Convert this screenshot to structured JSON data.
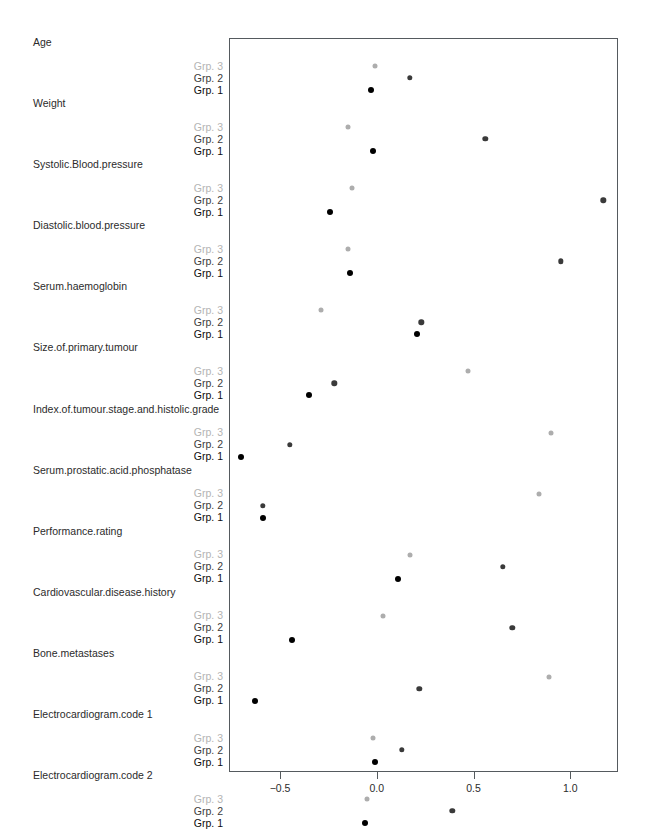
{
  "chart_data": {
    "type": "scatter",
    "title": "",
    "xlabel": "",
    "ylabel": "",
    "xlim": [
      -0.78,
      1.25
    ],
    "grid": false,
    "legend_position": "none",
    "axis_ticks": [
      {
        "value": -0.5,
        "label": "−0.5"
      },
      {
        "value": 0.0,
        "label": "0.0"
      },
      {
        "value": 0.5,
        "label": "0.5"
      },
      {
        "value": 1.0,
        "label": "1.0"
      }
    ],
    "series": [
      {
        "name": "Grp. 1",
        "color": "#000000",
        "style": "s1"
      },
      {
        "name": "Grp. 2",
        "color": "#3a3a3a",
        "style": "s2"
      },
      {
        "name": "Grp. 3",
        "color": "#adadad",
        "style": "s3"
      }
    ],
    "categories": [
      "Age",
      "Weight",
      "Systolic.Blood.pressure",
      "Diastolic.blood.pressure",
      "Serum.haemoglobin",
      "Size.of.primary.tumour",
      "Index.of.tumour.stage.and.histolic.grade",
      "Serum.prostatic.acid.phosphatase",
      "Performance.rating",
      "Cardiovascular.disease.history",
      "Bone.metastases",
      "Electrocardiogram.code 1",
      "Electrocardiogram.code 2"
    ],
    "groups": [
      {
        "category": "Age",
        "values": {
          "Grp. 1": -0.03,
          "Grp. 2": 0.17,
          "Grp. 3": -0.01
        }
      },
      {
        "category": "Weight",
        "values": {
          "Grp. 1": -0.02,
          "Grp. 2": 0.56,
          "Grp. 3": -0.15
        }
      },
      {
        "category": "Systolic.Blood.pressure",
        "values": {
          "Grp. 1": -0.24,
          "Grp. 2": 1.17,
          "Grp. 3": -0.13
        }
      },
      {
        "category": "Diastolic.blood.pressure",
        "values": {
          "Grp. 1": -0.14,
          "Grp. 2": 0.95,
          "Grp. 3": -0.15
        }
      },
      {
        "category": "Serum.haemoglobin",
        "values": {
          "Grp. 1": 0.21,
          "Grp. 2": 0.23,
          "Grp. 3": -0.29
        }
      },
      {
        "category": "Size.of.primary.tumour",
        "values": {
          "Grp. 1": -0.35,
          "Grp. 2": -0.22,
          "Grp. 3": 0.47
        }
      },
      {
        "category": "Index.of.tumour.stage.and.histolic.grade",
        "values": {
          "Grp. 1": -0.7,
          "Grp. 2": -0.45,
          "Grp. 3": 0.9
        }
      },
      {
        "category": "Serum.prostatic.acid.phosphatase",
        "values": {
          "Grp. 1": -0.59,
          "Grp. 2": -0.59,
          "Grp. 3": 0.84
        }
      },
      {
        "category": "Performance.rating",
        "values": {
          "Grp. 1": 0.11,
          "Grp. 2": 0.65,
          "Grp. 3": 0.17
        }
      },
      {
        "category": "Cardiovascular.disease.history",
        "values": {
          "Grp. 1": -0.44,
          "Grp. 2": 0.7,
          "Grp. 3": 0.03
        }
      },
      {
        "category": "Bone.metastases",
        "values": {
          "Grp. 1": -0.63,
          "Grp. 2": 0.22,
          "Grp. 3": 0.89
        }
      },
      {
        "category": "Electrocardiogram.code 1",
        "values": {
          "Grp. 1": -0.01,
          "Grp. 2": 0.13,
          "Grp. 3": -0.02
        }
      },
      {
        "category": "Electrocardiogram.code 2",
        "values": {
          "Grp. 1": -0.06,
          "Grp. 2": 0.39,
          "Grp. 3": -0.05
        }
      }
    ]
  }
}
